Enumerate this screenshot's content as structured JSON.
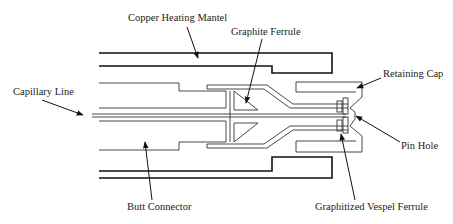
{
  "diagram": {
    "type": "cross-section schematic",
    "labels": {
      "copper_heating_mantel": "Copper Heating Mantel",
      "graphite_ferrule": "Graphite Ferrule",
      "retaining_cap": "Retaining Cap",
      "capillary_line": "Capillary Line",
      "pin_hole": "Pin Hole",
      "butt_connector": "Butt Connector",
      "graphitized_vespel_ferrule": "Graphitized Vespel Ferrule"
    },
    "colors": {
      "line": "#111111",
      "background": "#ffffff"
    }
  }
}
